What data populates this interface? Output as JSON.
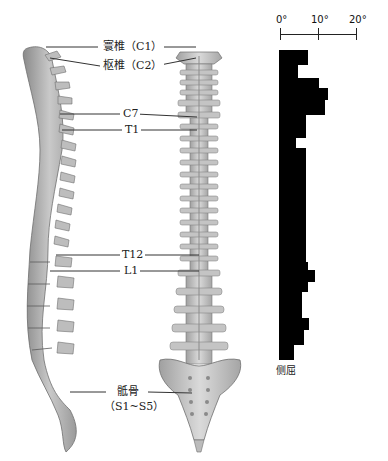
{
  "figure": {
    "labels": {
      "c1": "寰椎（C1）",
      "c2": "枢椎（C2）",
      "c7": "C7",
      "t1": "T1",
      "t12": "T12",
      "l1": "L1",
      "sacrum_name": "骶骨",
      "sacrum_range": "（S1~S5）"
    },
    "chart": {
      "axis_ticks": [
        "0°",
        "10°",
        "20°"
      ],
      "caption": "侧屈"
    }
  },
  "chart_data": {
    "type": "bar",
    "orientation": "horizontal",
    "title": "",
    "xlabel": "侧屈",
    "ylabel": "",
    "x_ticks": [
      "0°",
      "10°",
      "20°"
    ],
    "xlim": [
      0,
      20
    ],
    "grid": false,
    "legend": null,
    "segments": [
      {
        "y_start_px": 50,
        "y_end_px": 65,
        "value": 7.5
      },
      {
        "y_start_px": 65,
        "y_end_px": 78,
        "value": 5
      },
      {
        "y_start_px": 78,
        "y_end_px": 88,
        "value": 10.5
      },
      {
        "y_start_px": 88,
        "y_end_px": 100,
        "value": 13
      },
      {
        "y_start_px": 100,
        "y_end_px": 115,
        "value": 12
      },
      {
        "y_start_px": 115,
        "y_end_px": 138,
        "value": 7
      },
      {
        "y_start_px": 138,
        "y_end_px": 148,
        "value": 4.5
      },
      {
        "y_start_px": 148,
        "y_end_px": 262,
        "value": 7
      },
      {
        "y_start_px": 262,
        "y_end_px": 270,
        "value": 7.5
      },
      {
        "y_start_px": 270,
        "y_end_px": 282,
        "value": 9.5
      },
      {
        "y_start_px": 282,
        "y_end_px": 292,
        "value": 7.5
      },
      {
        "y_start_px": 292,
        "y_end_px": 318,
        "value": 6
      },
      {
        "y_start_px": 318,
        "y_end_px": 330,
        "value": 8
      },
      {
        "y_start_px": 330,
        "y_end_px": 345,
        "value": 6.5
      },
      {
        "y_start_px": 345,
        "y_end_px": 360,
        "value": 4
      }
    ]
  }
}
